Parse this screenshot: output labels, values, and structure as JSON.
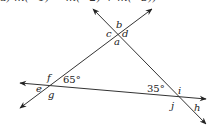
{
  "top_text_partial": "a)  m(∠1) = m(∠2) + m(∠3))",
  "diagram": {
    "lines": [
      {
        "name": "line-a",
        "x1": 152,
        "y1": 9,
        "x2": 20,
        "y2": 108
      },
      {
        "name": "line-b",
        "x1": 93,
        "y1": 9,
        "x2": 206,
        "y2": 124
      },
      {
        "name": "line-c",
        "x1": 20,
        "y1": 83,
        "x2": 206,
        "y2": 99
      }
    ],
    "point_labels": {
      "a": "a",
      "b": "b",
      "c": "c",
      "d": "d",
      "e": "e",
      "f": "f",
      "g": "g",
      "h": "h",
      "i": "i",
      "j": "j"
    },
    "angle_labels": {
      "left_angle": "65°",
      "right_angle": "35°"
    }
  }
}
